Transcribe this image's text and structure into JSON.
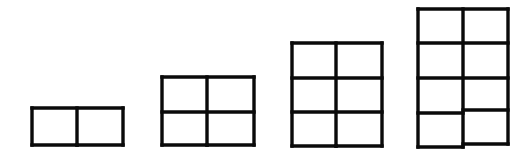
{
  "diagram": {
    "stroke_color": "#0a0a0a",
    "background": "#ffffff",
    "figures": [
      {
        "name": "figure-1",
        "columns": 2,
        "rows": 1,
        "cells": 2,
        "x": 32,
        "y": 108,
        "width": 91,
        "height": 37,
        "col_dividers": [
          77
        ],
        "row_dividers": []
      },
      {
        "name": "figure-2",
        "columns": 2,
        "rows": 2,
        "cells": 4,
        "x": 162,
        "y": 77,
        "width": 92,
        "height": 68,
        "col_dividers": [
          207
        ],
        "row_dividers": [
          112
        ]
      },
      {
        "name": "figure-3",
        "columns": 2,
        "rows": 3,
        "cells": 6,
        "x": 292,
        "y": 43,
        "width": 90,
        "height": 103,
        "col_dividers": [
          336
        ],
        "row_dividers": [
          78,
          112
        ]
      },
      {
        "name": "figure-4",
        "columns": 2,
        "rows": 4,
        "cells": 8,
        "x": 418,
        "y": 9,
        "width": 90,
        "height": 138,
        "col_dividers": [
          463
        ],
        "row_dividers": [
          43,
          78
        ],
        "left_row_divider_bottom": 113,
        "right_row_divider_bottom": 110,
        "left_bottom": 147,
        "right_bottom": 144
      }
    ]
  }
}
